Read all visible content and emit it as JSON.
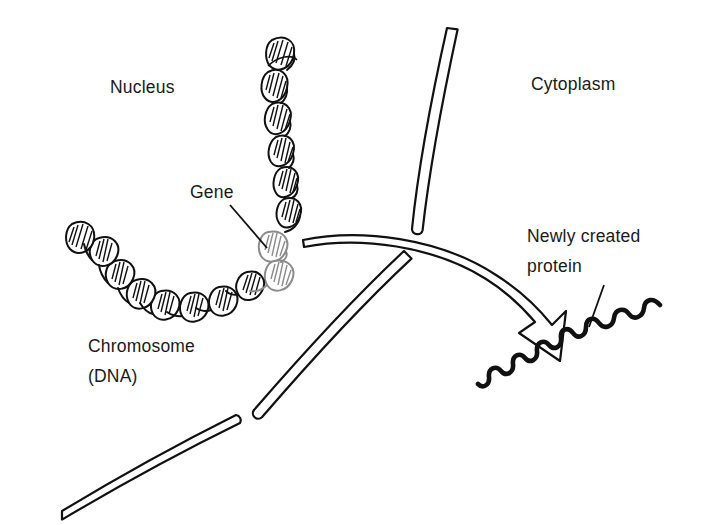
{
  "figure": {
    "background_color": "#ffffff",
    "ink_color": "#111111",
    "gene_highlight_color": "#8c8c8c"
  },
  "labels": {
    "nucleus": "Nucleus",
    "cytoplasm": "Cytoplasm",
    "gene": "Gene",
    "chromosome_line1": "Chromosome",
    "chromosome_line2": "(DNA)",
    "protein_line1": "Newly created",
    "protein_line2": "protein"
  },
  "elements": {
    "chromosome_name": "chromosome-dna-helix",
    "gene_segment_name": "gene-segment",
    "nuclear_membrane_name": "nuclear-membrane",
    "transport_arrow_name": "transport-arrow",
    "protein_name": "protein-squiggle",
    "gene_leader_name": "gene-leader-line",
    "protein_leader_name": "protein-leader-line"
  }
}
